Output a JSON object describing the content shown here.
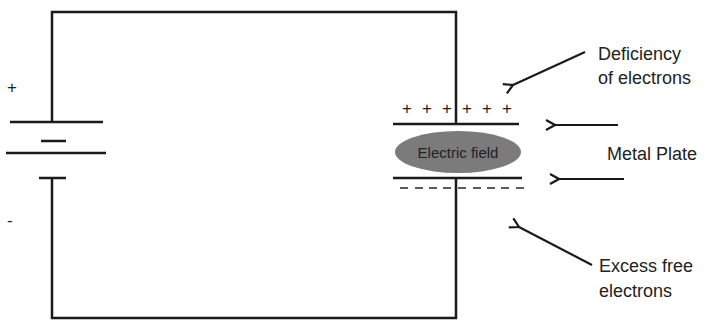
{
  "diagram": {
    "battery": {
      "positive_label": "+",
      "negative_label": "-"
    },
    "capacitor": {
      "field_label": "Electric field",
      "top_charges": [
        "+",
        "+",
        "+",
        "+",
        "+",
        "+"
      ],
      "bottom_charges": [
        "-",
        "-",
        "-",
        "-",
        "-",
        "-",
        "-",
        "-",
        "-"
      ]
    },
    "annotations": {
      "deficiency_line1": "Deficiency",
      "deficiency_line2": "of electrons",
      "metal_plate": "Metal Plate",
      "excess_line1": "Excess free",
      "excess_line2": "electrons"
    },
    "colors": {
      "line": "#1a1a1a",
      "field_fill": "#7b7b7b",
      "text": "#222222"
    }
  }
}
